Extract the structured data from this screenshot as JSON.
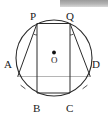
{
  "figure": {
    "stroke_color": "#2b2b2b",
    "background_color": "#ffffff",
    "label_color": "#1a1a1a",
    "artifact_color": "#b4b4b4"
  },
  "circle": {
    "center_label": "O",
    "center_x": 54,
    "center_y": 58,
    "radius": 38
  },
  "points": [
    {
      "id": "A",
      "label": "A",
      "x": 17.7,
      "y": 76.6,
      "label_x": 4,
      "label_y": 59
    },
    {
      "id": "B",
      "label": "B",
      "x": 37.0,
      "y": 93.0,
      "label_x": 33,
      "label_y": 103
    },
    {
      "id": "C",
      "label": "C",
      "x": 70.0,
      "y": 93.0,
      "label_x": 66,
      "label_y": 103
    },
    {
      "id": "D",
      "label": "D",
      "x": 90.3,
      "y": 76.6,
      "label_x": 92,
      "label_y": 59
    },
    {
      "id": "P",
      "label": "P",
      "x": 37.0,
      "y": 23.5,
      "label_x": 30,
      "label_y": 11
    },
    {
      "id": "Q",
      "label": "Q",
      "x": 70.0,
      "y": 23.5,
      "label_x": 66,
      "label_y": 11
    }
  ],
  "chords": [
    {
      "id": "PA",
      "from": "P",
      "to": "A"
    },
    {
      "id": "PB",
      "from": "P",
      "to": "B"
    },
    {
      "id": "QC",
      "from": "Q",
      "to": "C"
    },
    {
      "id": "QD",
      "from": "Q",
      "to": "D"
    },
    {
      "id": "PQ",
      "from": "P",
      "to": "Q"
    },
    {
      "id": "BC",
      "from": "B",
      "to": "C"
    },
    {
      "id": "AD",
      "from": "A",
      "to": "D"
    }
  ],
  "angle_marks": [
    {
      "id": "angle-at-P",
      "vertex": "P",
      "x": 39.5,
      "y": 32.0
    },
    {
      "id": "angle-at-Q",
      "vertex": "Q",
      "x": 67.5,
      "y": 32.0
    }
  ],
  "arc_ticks": [
    {
      "id": "tick-arc-AB",
      "x": 23.0,
      "y": 87.0,
      "angle": -42
    },
    {
      "id": "tick-arc-CD",
      "x": 85.0,
      "y": 87.0,
      "angle": 42
    }
  ]
}
